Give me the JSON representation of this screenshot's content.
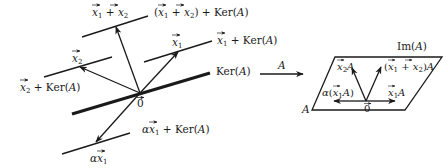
{
  "diagram": {
    "left_panel": {
      "origin_label": "0",
      "kernel_label": "Ker(A)",
      "cosets": [
        {
          "vector_label": "x1 + x2",
          "coset_label": "(x1 + x2) + Ker(A)"
        },
        {
          "vector_label": "x1",
          "coset_label": "x1 + Ker(A)"
        },
        {
          "vector_label": "x2",
          "coset_label": "x2 + Ker(A)"
        },
        {
          "vector_label": "αx1",
          "coset_label": "αx1 + Ker(A)"
        }
      ]
    },
    "mapping_arrow": {
      "label": "A"
    },
    "right_panel": {
      "image_label": "Im(A)",
      "plane_label": "A",
      "origin_label": "0",
      "vectors": [
        {
          "label": "x2A"
        },
        {
          "label": "(x1 + x2)A"
        },
        {
          "label": "x1A"
        },
        {
          "label": "α(x1A)"
        }
      ]
    }
  }
}
